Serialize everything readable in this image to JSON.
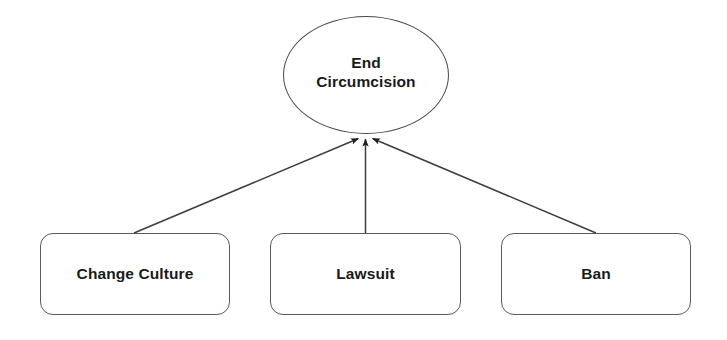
{
  "diagram": {
    "type": "goal-strategy-tree",
    "background_color": "#ffffff",
    "stroke_color": "#4a4a4a",
    "text_color": "#1a1a1a",
    "goal": {
      "id": "end-circumcision",
      "shape": "ellipse",
      "label": "End\nCircumcision",
      "label_line_1": "End",
      "label_line_2": "Circumcision"
    },
    "strategies": [
      {
        "id": "change-culture",
        "shape": "rounded-rectangle",
        "label": "Change Culture"
      },
      {
        "id": "lawsuit",
        "shape": "rounded-rectangle",
        "label": "Lawsuit"
      },
      {
        "id": "ban",
        "shape": "rounded-rectangle",
        "label": "Ban"
      }
    ],
    "edges": [
      {
        "id": "edge-change-culture-to-goal",
        "from": "change-culture",
        "to": "end-circumcision",
        "arrow": "to-goal"
      },
      {
        "id": "edge-lawsuit-to-goal",
        "from": "lawsuit",
        "to": "end-circumcision",
        "arrow": "to-goal"
      },
      {
        "id": "edge-ban-to-goal",
        "from": "ban",
        "to": "end-circumcision",
        "arrow": "to-goal"
      }
    ]
  }
}
